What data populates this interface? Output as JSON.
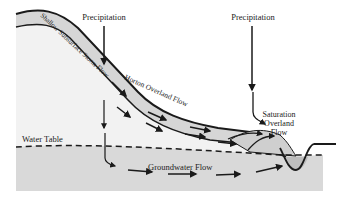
{
  "diagram": {
    "type": "hillslope runoff processes cross-section",
    "labels": {
      "precipitation_left": "Precipitation",
      "precipitation_right": "Precipitation",
      "shallow_subsurface": "Shallow Subsurface Storm Flow",
      "horton": "Horton Overland Flow",
      "saturation_line1": "Saturation",
      "saturation_line2": "Overland",
      "saturation_line3": "Flow",
      "water_table": "Water Table",
      "groundwater": "Groundwater Flow"
    },
    "colors": {
      "hill_fill": "#f2f2f2",
      "soil_layer": "#d6d6d6",
      "groundwater_fill": "#d9d9d9",
      "channel_water": "#bdbdbd",
      "line": "#1a1a1a"
    }
  }
}
